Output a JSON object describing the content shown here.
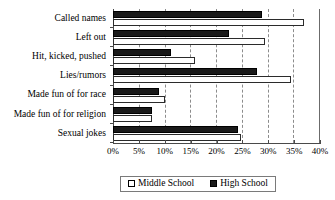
{
  "chart_data": {
    "type": "bar",
    "orientation": "horizontal",
    "title": "",
    "xlabel": "",
    "ylabel": "",
    "xlim": [
      0,
      40
    ],
    "grid": true,
    "legend_position": "bottom",
    "tick_labels": [
      "0%",
      "5%",
      "10%",
      "15%",
      "20%",
      "25%",
      "30%",
      "35%",
      "40%"
    ],
    "tick_values": [
      0,
      5,
      10,
      15,
      20,
      25,
      30,
      35,
      40
    ],
    "categories": [
      "Called names",
      "Left out",
      "Hit, kicked, pushed",
      "Lies/rumors",
      "Made fun of for race",
      "Made fun of for religion",
      "Sexual jokes"
    ],
    "series": [
      {
        "name": "Middle School",
        "color": "#ffffff",
        "values": [
          37,
          29.5,
          16,
          34.5,
          10,
          7.5,
          24.8
        ]
      },
      {
        "name": "High School",
        "color": "#1a1a1a",
        "values": [
          29,
          22.5,
          11.3,
          28,
          9,
          7.5,
          24.3
        ]
      }
    ]
  },
  "legend": {
    "entries": [
      {
        "label": "Middle School",
        "swatch": "middle"
      },
      {
        "label": "High School",
        "swatch": "high"
      }
    ]
  }
}
